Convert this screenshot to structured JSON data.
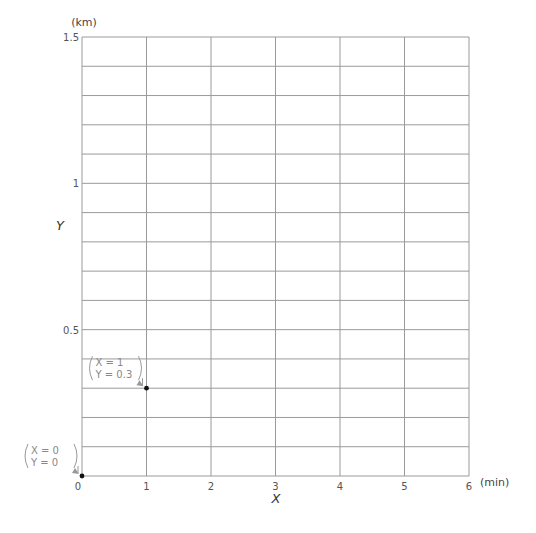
{
  "chart_data": {
    "type": "scatter",
    "title": "",
    "xlabel": "X",
    "ylabel": "Y",
    "x_unit": "(min)",
    "y_unit": "(km)",
    "xlim": [
      0,
      6
    ],
    "ylim": [
      0,
      1.5
    ],
    "x_ticks": [
      "0",
      "1",
      "2",
      "3",
      "4",
      "5",
      "6"
    ],
    "y_ticks": [
      {
        "value": 0.5,
        "label": "0.5"
      },
      {
        "value": 1,
        "label": "1"
      },
      {
        "value": 1.5,
        "label": "1.5"
      }
    ],
    "grid": true,
    "x_grid_step": 1,
    "y_grid_step": 0.1,
    "points": [
      {
        "x": 0,
        "y": 0,
        "label_line1": "X = 0",
        "label_line2": "Y = 0"
      },
      {
        "x": 1,
        "y": 0.3,
        "label_line1": "X = 1",
        "label_line2": "Y = 0.3"
      }
    ]
  },
  "layout": {
    "grid_color": "#9a9a9a",
    "point_color": "#111111"
  }
}
